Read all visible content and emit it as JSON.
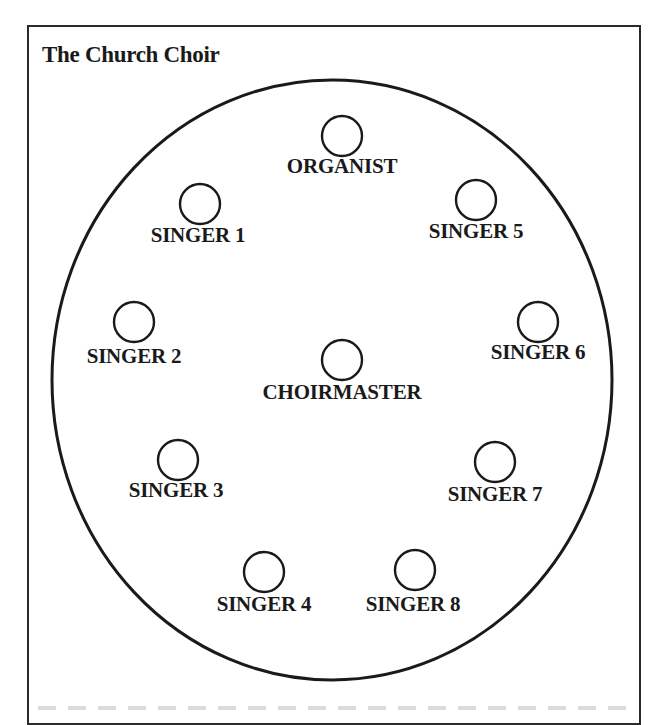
{
  "title": "The Church Choir",
  "colors": {
    "stroke": "#1a1a1a",
    "background": "#ffffff"
  },
  "arena": {
    "cx": 332,
    "cy": 380,
    "rx": 280,
    "ry": 300
  },
  "positions": [
    {
      "id": "organist",
      "label": "ORGANIST",
      "cx": 342,
      "cy": 136,
      "lx": 342,
      "ly": 170
    },
    {
      "id": "singer-1",
      "label": "SINGER 1",
      "cx": 200,
      "cy": 204,
      "lx": 198,
      "ly": 239
    },
    {
      "id": "singer-5",
      "label": "SINGER 5",
      "cx": 476,
      "cy": 200,
      "lx": 476,
      "ly": 235
    },
    {
      "id": "singer-2",
      "label": "SINGER 2",
      "cx": 134,
      "cy": 322,
      "lx": 134,
      "ly": 360
    },
    {
      "id": "singer-6",
      "label": "SINGER 6",
      "cx": 538,
      "cy": 322,
      "lx": 538,
      "ly": 356
    },
    {
      "id": "choirmaster",
      "label": "CHOIRMASTER",
      "cx": 342,
      "cy": 360,
      "lx": 342,
      "ly": 396
    },
    {
      "id": "singer-3",
      "label": "SINGER 3",
      "cx": 178,
      "cy": 460,
      "lx": 176,
      "ly": 494
    },
    {
      "id": "singer-7",
      "label": "SINGER 7",
      "cx": 495,
      "cy": 462,
      "lx": 495,
      "ly": 498
    },
    {
      "id": "singer-4",
      "label": "SINGER 4",
      "cx": 264,
      "cy": 572,
      "lx": 264,
      "ly": 608
    },
    {
      "id": "singer-8",
      "label": "SINGER 8",
      "cx": 415,
      "cy": 570,
      "lx": 413,
      "ly": 608
    }
  ]
}
